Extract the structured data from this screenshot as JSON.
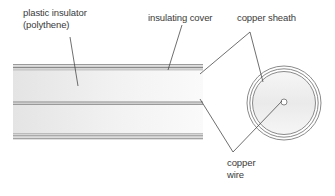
{
  "diagram": {
    "labels": {
      "plastic_insulator": {
        "line1": "plastic insulator",
        "line2": "(polythene)"
      },
      "insulating_cover": "insulating cover",
      "copper_sheath": "copper sheath",
      "copper_wire": {
        "line1": "copper",
        "line2": "wire"
      }
    },
    "colors": {
      "line": "#555555",
      "stripe_dark": "#8a8a8a",
      "stripe_light": "#c8c8c8",
      "fill_light": "#f4f4f4",
      "fill_shade": "#e6e6e6",
      "text": "#3a3a3a"
    },
    "components": [
      "plastic insulator (polythene)",
      "insulating cover",
      "copper sheath",
      "copper wire"
    ]
  }
}
